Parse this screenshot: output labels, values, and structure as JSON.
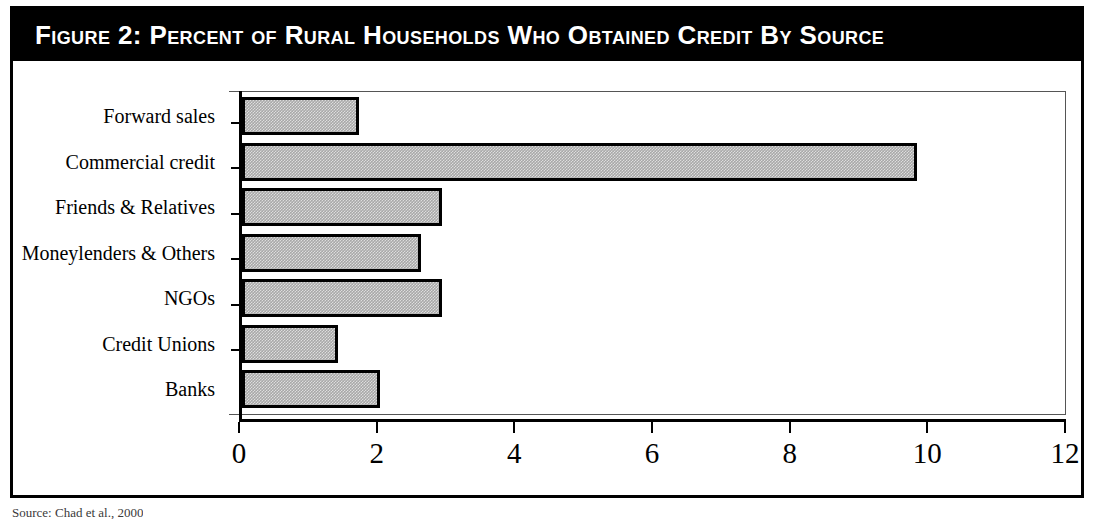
{
  "figure": {
    "title": "Figure 2:  Percent of Rural Households Who Obtained Credit By Source",
    "source_note": "Source: Chad et al., 2000"
  },
  "chart_data": {
    "type": "bar",
    "orientation": "horizontal",
    "title": "Figure 2:  Percent of Rural Households Who Obtained Credit By Source",
    "xlabel": "",
    "ylabel": "",
    "categories": [
      "Forward sales",
      "Commercial credit",
      "Friends & Relatives",
      "Moneylenders & Others",
      "NGOs",
      "Credit Unions",
      "Banks"
    ],
    "values": [
      1.7,
      9.8,
      2.9,
      2.6,
      2.9,
      1.4,
      2.0
    ],
    "xlim": [
      0,
      12
    ],
    "xticks": [
      0,
      2,
      4,
      6,
      8,
      10,
      12
    ],
    "xtick_labels": [
      "0",
      "2",
      "4",
      "6",
      "8",
      "10",
      "12"
    ],
    "grid": false,
    "legend": false,
    "bar_fill": "#a8a8a8",
    "bar_edge": "#000000"
  }
}
